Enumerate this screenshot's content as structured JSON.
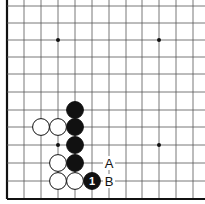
{
  "diagram": {
    "type": "go-board-fragment",
    "grid": {
      "x_lines": [
        7,
        24,
        41,
        58,
        75,
        92,
        109,
        126,
        142,
        159,
        176,
        193
      ],
      "y_lines": [
        6,
        23,
        40,
        57,
        74,
        92,
        110,
        127,
        145,
        163,
        181,
        199
      ],
      "left_edge": true,
      "bottom_edge": true,
      "line_color": "#555555",
      "edge_color": "#111111"
    },
    "star_points": [
      {
        "x": 58,
        "y": 40
      },
      {
        "x": 159,
        "y": 40
      },
      {
        "x": 58,
        "y": 145
      },
      {
        "x": 159,
        "y": 145
      }
    ],
    "stones": [
      {
        "color": "black",
        "x": 75,
        "y": 110,
        "label": ""
      },
      {
        "color": "black",
        "x": 75,
        "y": 127,
        "label": ""
      },
      {
        "color": "black",
        "x": 75,
        "y": 145,
        "label": ""
      },
      {
        "color": "black",
        "x": 75,
        "y": 163,
        "label": ""
      },
      {
        "color": "black",
        "x": 92,
        "y": 181,
        "label": "1"
      },
      {
        "color": "white",
        "x": 41,
        "y": 127,
        "label": ""
      },
      {
        "color": "white",
        "x": 58,
        "y": 127,
        "label": ""
      },
      {
        "color": "white",
        "x": 58,
        "y": 163,
        "label": ""
      },
      {
        "color": "white",
        "x": 58,
        "y": 181,
        "label": ""
      },
      {
        "color": "white",
        "x": 75,
        "y": 181,
        "label": ""
      }
    ],
    "markers": [
      {
        "text": "A",
        "x": 109,
        "y": 163
      },
      {
        "text": "B",
        "x": 109,
        "y": 181
      }
    ]
  }
}
